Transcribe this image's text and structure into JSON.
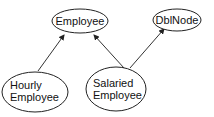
{
  "diagram": {
    "type": "class-inheritance-graph",
    "nodes": [
      {
        "id": "employee",
        "lines": [
          "Employee"
        ],
        "cx": 80,
        "cy": 21,
        "rx": 28,
        "ry": 12
      },
      {
        "id": "dblnode",
        "lines": [
          "DblNode"
        ],
        "cx": 177,
        "cy": 20,
        "rx": 24,
        "ry": 11
      },
      {
        "id": "hourly",
        "lines": [
          "Hourly",
          "Employee"
        ],
        "cx": 35,
        "cy": 92,
        "rx": 33,
        "ry": 20
      },
      {
        "id": "salaried",
        "lines": [
          "Salaried",
          "Employee"
        ],
        "cx": 116,
        "cy": 89,
        "rx": 30,
        "ry": 22
      }
    ],
    "edges": [
      {
        "from": "hourly",
        "to": "employee",
        "x1": 38,
        "y1": 71,
        "x2": 64,
        "y2": 35
      },
      {
        "from": "salaried",
        "to": "employee",
        "x1": 124,
        "y1": 68,
        "x2": 94,
        "y2": 35
      },
      {
        "from": "salaried",
        "to": "dblnode",
        "x1": 130,
        "y1": 68,
        "x2": 164,
        "y2": 29
      }
    ],
    "colors": {
      "stroke": "#222222",
      "background": "#ffffff",
      "text": "#111111"
    }
  }
}
